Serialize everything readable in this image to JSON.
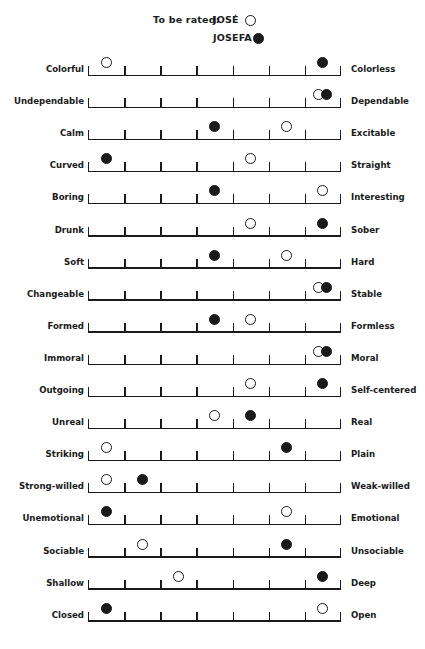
{
  "legend": {
    "prefix": "To be rated:",
    "items": [
      {
        "name": "JOSÉ",
        "marker": "open-circle"
      },
      {
        "name": "JOSEFA",
        "marker": "filled-circle"
      }
    ]
  },
  "scale": {
    "intervals": 7,
    "ticks": 8
  },
  "rows": [
    {
      "left": "Colorful",
      "right": "Colorless",
      "jose": 1,
      "josefa": 7
    },
    {
      "left": "Undependable",
      "right": "Dependable",
      "jose": 7,
      "josefa": 7
    },
    {
      "left": "Calm",
      "right": "Excitable",
      "jose": 6,
      "josefa": 4
    },
    {
      "left": "Curved",
      "right": "Straight",
      "jose": 5,
      "josefa": 1
    },
    {
      "left": "Boring",
      "right": "Interesting",
      "jose": 7,
      "josefa": 4
    },
    {
      "left": "Drunk",
      "right": "Sober",
      "jose": 5,
      "josefa": 7
    },
    {
      "left": "Soft",
      "right": "Hard",
      "jose": 6,
      "josefa": 4
    },
    {
      "left": "Changeable",
      "right": "Stable",
      "jose": 7,
      "josefa": 7
    },
    {
      "left": "Formed",
      "right": "Formless",
      "jose": 5,
      "josefa": 4
    },
    {
      "left": "Immoral",
      "right": "Moral",
      "jose": 7,
      "josefa": 7
    },
    {
      "left": "Outgoing",
      "right": "Self-centered",
      "jose": 5,
      "josefa": 7
    },
    {
      "left": "Unreal",
      "right": "Real",
      "jose": 4,
      "josefa": 5
    },
    {
      "left": "Striking",
      "right": "Plain",
      "jose": 1,
      "josefa": 6
    },
    {
      "left": "Strong-willed",
      "right": "Weak-willed",
      "jose": 1,
      "josefa": 2
    },
    {
      "left": "Unemotional",
      "right": "Emotional",
      "jose": 6,
      "josefa": 1
    },
    {
      "left": "Sociable",
      "right": "Unsociable",
      "jose": 2,
      "josefa": 6
    },
    {
      "left": "Shallow",
      "right": "Deep",
      "jose": 3,
      "josefa": 7
    },
    {
      "left": "Closed",
      "right": "Open",
      "jose": 7,
      "josefa": 1
    }
  ],
  "chart_data": {
    "type": "scatter",
    "subtitle": "To be rated: JOSÉ (open circle), JOSEFA (filled circle)",
    "xlabel": "7-point bipolar scale (1 = left adjective, 7 = right adjective)",
    "ylabel": "",
    "xlim": [
      1,
      7
    ],
    "grid": false,
    "legend_position": "top",
    "categories": [
      "Colorful–Colorless",
      "Undependable–Dependable",
      "Calm–Excitable",
      "Curved–Straight",
      "Boring–Interesting",
      "Drunk–Sober",
      "Soft–Hard",
      "Changeable–Stable",
      "Formed–Formless",
      "Immoral–Moral",
      "Outgoing–Self-centered",
      "Unreal–Real",
      "Striking–Plain",
      "Strong-willed–Weak-willed",
      "Unemotional–Emotional",
      "Sociable–Unsociable",
      "Shallow–Deep",
      "Closed–Open"
    ],
    "series": [
      {
        "name": "JOSÉ",
        "marker": "open-circle",
        "values": [
          1,
          7,
          6,
          5,
          7,
          5,
          6,
          7,
          5,
          7,
          5,
          4,
          1,
          1,
          6,
          2,
          3,
          7
        ]
      },
      {
        "name": "JOSEFA",
        "marker": "filled-circle",
        "values": [
          7,
          7,
          4,
          1,
          4,
          7,
          4,
          7,
          4,
          7,
          7,
          5,
          6,
          2,
          1,
          6,
          7,
          1
        ]
      }
    ]
  }
}
